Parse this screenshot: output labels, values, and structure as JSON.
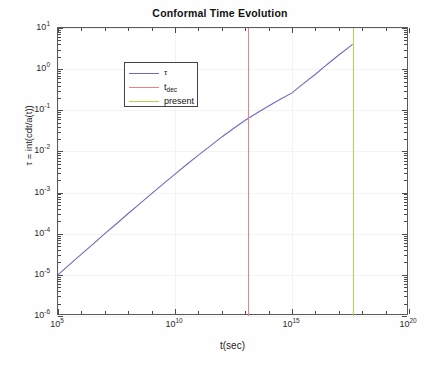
{
  "chart_data": {
    "type": "line",
    "title": "Conformal Time Evolution",
    "xlabel": "t(sec)",
    "ylabel": "τ = int(cdt/a(t))",
    "xscale": "log",
    "yscale": "log",
    "xlim": [
      100000.0,
      1e+20
    ],
    "ylim": [
      1e-06,
      10.0
    ],
    "grid": true,
    "legend_position": "upper left",
    "xticks": [
      {
        "value": 100000.0,
        "base": "10",
        "exp": "5"
      },
      {
        "value": 10000000000.0,
        "base": "10",
        "exp": "10"
      },
      {
        "value": 1000000000000000.0,
        "base": "10",
        "exp": "15"
      },
      {
        "value": 1e+20,
        "base": "10",
        "exp": "20"
      }
    ],
    "yticks": [
      {
        "value": 10.0,
        "base": "10",
        "exp": "1"
      },
      {
        "value": 1.0,
        "base": "10",
        "exp": "0"
      },
      {
        "value": 0.1,
        "base": "10",
        "exp": "-1"
      },
      {
        "value": 0.01,
        "base": "10",
        "exp": "-2"
      },
      {
        "value": 0.001,
        "base": "10",
        "exp": "-3"
      },
      {
        "value": 0.0001,
        "base": "10",
        "exp": "-4"
      },
      {
        "value": 1e-05,
        "base": "10",
        "exp": "-5"
      },
      {
        "value": 1e-06,
        "base": "10",
        "exp": "-6"
      }
    ],
    "series": [
      {
        "name": "τ",
        "type": "line",
        "color": "#6b6bc4",
        "x": [
          100000.0,
          316000.0,
          1000000.0,
          3160000.0,
          10000000.0,
          31600000.0,
          100000000.0,
          316000000.0,
          1000000000.0,
          3160000000.0,
          10000000000.0,
          31600000000.0,
          100000000000.0,
          316000000000.0,
          1000000000000.0,
          3160000000000.0,
          10000000000000.0,
          31600000000000.0,
          100000000000000.0,
          316000000000000.0,
          1000000000000000.0,
          3160000000000000.0,
          1e+16,
          3.16e+16,
          1e+17,
          3.9e+17
        ],
        "y": [
          1e-05,
          1.8e-05,
          3.2e-05,
          5.6e-05,
          0.0001,
          0.000175,
          0.00031,
          0.00054,
          0.00094,
          0.00162,
          0.0028,
          0.0048,
          0.0081,
          0.0135,
          0.0225,
          0.036,
          0.057,
          0.086,
          0.127,
          0.185,
          0.265,
          0.45,
          0.75,
          1.3,
          2.2,
          4.0
        ]
      },
      {
        "name": "t_dec",
        "label_base": "t",
        "label_sub": "dec",
        "type": "vline",
        "color": "#f08080",
        "x": 13000000000000.0
      },
      {
        "name": "present",
        "type": "vline",
        "color": "#a8d84a",
        "x": 4e+17
      }
    ],
    "annotations": {
      "tau_at_tdec": 0.08,
      "tau_at_present": 4.0
    }
  },
  "figure": {
    "background": "#ffffff",
    "axes_color": "#5a5a5a",
    "grid_color": "#f3f3f3"
  }
}
